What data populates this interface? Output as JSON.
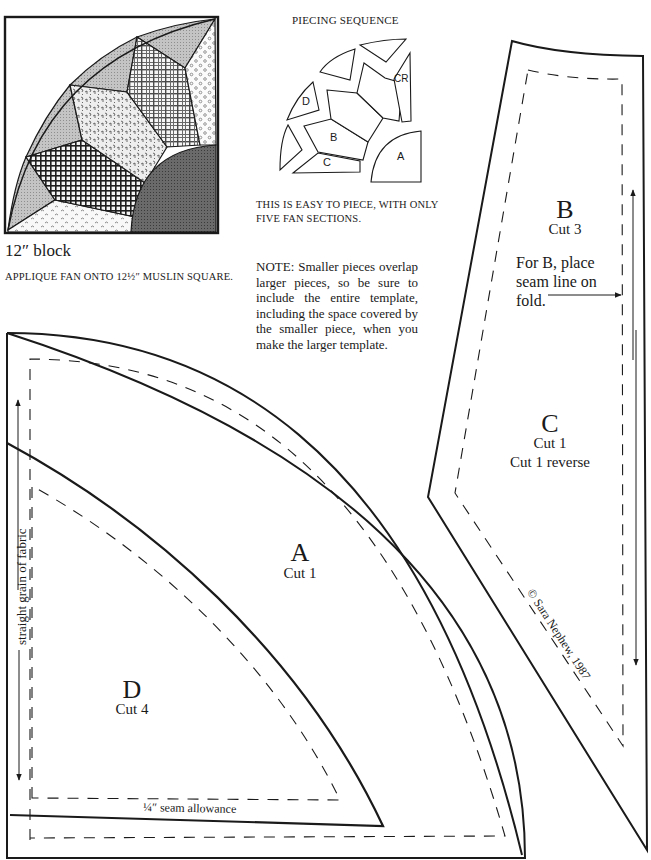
{
  "block": {
    "caption": "12″ block",
    "instruction": "APPLIQUE FAN ONTO 12½″ MUSLIN SQUARE.",
    "colors": {
      "outline": "#1a1a1a",
      "gray_blade": "#b5b5b5",
      "dark_center": "#5a5a5a",
      "check": "#2a2a2a"
    }
  },
  "piecing": {
    "title": "PIECING SEQUENCE",
    "labels": {
      "a": "A",
      "b": "B",
      "c": "C",
      "cr": "CR",
      "d": "D"
    },
    "description": "THIS IS EASY TO PIECE, WITH ONLY FIVE FAN SECTIONS."
  },
  "note": {
    "text": "NOTE: Smaller pieces overlap larger pieces, so be sure to include the entire template, including the space covered by the smaller piece, when you make the larger template."
  },
  "templates": {
    "a": {
      "letter": "A",
      "cut": "Cut 1"
    },
    "b": {
      "letter": "B",
      "cut": "Cut 3",
      "fold_note": "For B, place seam line on fold."
    },
    "c": {
      "letter": "C",
      "cut": "Cut 1",
      "cut_reverse": "Cut 1 reverse"
    },
    "d": {
      "letter": "D",
      "cut": "Cut 4"
    }
  },
  "annotations": {
    "grain": "straight grain of fabric",
    "seam_allowance": "¼″ seam allowance",
    "copyright": "© Sara Nephew, 1987"
  }
}
